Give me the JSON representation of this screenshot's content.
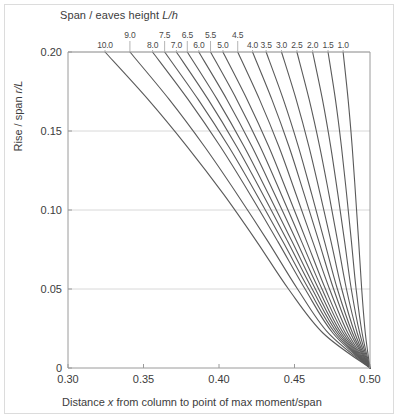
{
  "figure": {
    "background": "#ffffff",
    "frame_color": "#dcdcdc",
    "curve_color": "#5a5a5a",
    "grid_color": "#d8d8d8",
    "axis_color": "#9a9a9a",
    "text_color": "#3c3c3c"
  },
  "top_title": "Span / eaves height ",
  "top_title_italic": "L/h",
  "ylabel_text": "Rise / span ",
  "ylabel_italic": "r/L",
  "xlabel_pre": "Distance ",
  "xlabel_italic": "x",
  "xlabel_post": " from column to point of max moment/span",
  "chart_data": {
    "type": "line",
    "title": "Span / eaves height L/h",
    "xlabel": "Distance x from column to point of max moment/span",
    "ylabel": "Rise / span r/L",
    "xlim": [
      0.3,
      0.5
    ],
    "ylim": [
      0,
      0.2
    ],
    "xticks": [
      "0.30",
      "0.35",
      "0.40",
      "0.45",
      "0.50"
    ],
    "xtick_values": [
      0.3,
      0.35,
      0.4,
      0.45,
      0.5
    ],
    "yticks": [
      "0",
      "0.05",
      "0.10",
      "0.15",
      "0.20"
    ],
    "ytick_values": [
      0,
      0.05,
      0.1,
      0.15,
      0.2
    ],
    "grid": "horizontal",
    "legend": "none",
    "convergence_point": [
      0.5,
      0
    ],
    "series_label_name": "L/h",
    "series": [
      {
        "name": "10.0",
        "label": "10.0",
        "label_row": 1,
        "top_x": 0.3245,
        "values": [
          [
            0.3245,
            0.2
          ],
          [
            0.353,
            0.17
          ],
          [
            0.379,
            0.14
          ],
          [
            0.403,
            0.11
          ],
          [
            0.425,
            0.08
          ],
          [
            0.446,
            0.05
          ],
          [
            0.469,
            0.022
          ],
          [
            0.5,
            0.0
          ]
        ]
      },
      {
        "name": "9.0",
        "label": "9.0",
        "label_row": 0,
        "top_x": 0.341,
        "values": [
          [
            0.341,
            0.2
          ],
          [
            0.367,
            0.17
          ],
          [
            0.3905,
            0.14
          ],
          [
            0.412,
            0.11
          ],
          [
            0.4325,
            0.08
          ],
          [
            0.452,
            0.05
          ],
          [
            0.4725,
            0.022
          ],
          [
            0.5,
            0.0
          ]
        ]
      },
      {
        "name": "8.0",
        "label": "8.0",
        "label_row": 1,
        "top_x": 0.356,
        "values": [
          [
            0.356,
            0.2
          ],
          [
            0.3795,
            0.17
          ],
          [
            0.401,
            0.14
          ],
          [
            0.4205,
            0.11
          ],
          [
            0.439,
            0.08
          ],
          [
            0.457,
            0.05
          ],
          [
            0.4755,
            0.022
          ],
          [
            0.5,
            0.0
          ]
        ]
      },
      {
        "name": "7.5",
        "label": "7.5",
        "label_row": 0,
        "top_x": 0.364,
        "values": [
          [
            0.364,
            0.2
          ],
          [
            0.3862,
            0.17
          ],
          [
            0.4065,
            0.14
          ],
          [
            0.4248,
            0.11
          ],
          [
            0.4423,
            0.08
          ],
          [
            0.4594,
            0.05
          ],
          [
            0.477,
            0.022
          ],
          [
            0.5,
            0.0
          ]
        ]
      },
      {
        "name": "7.0",
        "label": "7.0",
        "label_row": 1,
        "top_x": 0.3718,
        "values": [
          [
            0.3718,
            0.2
          ],
          [
            0.3928,
            0.17
          ],
          [
            0.4118,
            0.14
          ],
          [
            0.429,
            0.11
          ],
          [
            0.4455,
            0.08
          ],
          [
            0.4617,
            0.05
          ],
          [
            0.4784,
            0.022
          ],
          [
            0.5,
            0.0
          ]
        ]
      },
      {
        "name": "6.5",
        "label": "6.5",
        "label_row": 0,
        "top_x": 0.379,
        "values": [
          [
            0.379,
            0.2
          ],
          [
            0.3988,
            0.17
          ],
          [
            0.4167,
            0.14
          ],
          [
            0.4328,
            0.11
          ],
          [
            0.4484,
            0.08
          ],
          [
            0.4638,
            0.05
          ],
          [
            0.4797,
            0.022
          ],
          [
            0.5,
            0.0
          ]
        ]
      },
      {
        "name": "6.0",
        "label": "6.0",
        "label_row": 1,
        "top_x": 0.3866,
        "values": [
          [
            0.3866,
            0.2
          ],
          [
            0.4052,
            0.17
          ],
          [
            0.4219,
            0.14
          ],
          [
            0.4369,
            0.11
          ],
          [
            0.4515,
            0.08
          ],
          [
            0.466,
            0.05
          ],
          [
            0.481,
            0.022
          ],
          [
            0.5,
            0.0
          ]
        ]
      },
      {
        "name": "5.5",
        "label": "5.5",
        "label_row": 0,
        "top_x": 0.3944,
        "values": [
          [
            0.3944,
            0.2
          ],
          [
            0.4117,
            0.17
          ],
          [
            0.4273,
            0.14
          ],
          [
            0.4412,
            0.11
          ],
          [
            0.4547,
            0.08
          ],
          [
            0.4682,
            0.05
          ],
          [
            0.4824,
            0.022
          ],
          [
            0.5,
            0.0
          ]
        ]
      },
      {
        "name": "5.0",
        "label": "5.0",
        "label_row": 1,
        "top_x": 0.4026,
        "values": [
          [
            0.4026,
            0.2
          ],
          [
            0.4186,
            0.17
          ],
          [
            0.433,
            0.14
          ],
          [
            0.4457,
            0.11
          ],
          [
            0.4581,
            0.08
          ],
          [
            0.4705,
            0.05
          ],
          [
            0.4838,
            0.022
          ],
          [
            0.5,
            0.0
          ]
        ]
      },
      {
        "name": "4.5",
        "label": "4.5",
        "label_row": 0,
        "top_x": 0.4124,
        "values": [
          [
            0.4124,
            0.2
          ],
          [
            0.4268,
            0.17
          ],
          [
            0.4397,
            0.14
          ],
          [
            0.451,
            0.11
          ],
          [
            0.4621,
            0.08
          ],
          [
            0.4732,
            0.05
          ],
          [
            0.4854,
            0.022
          ],
          [
            0.5,
            0.0
          ]
        ]
      },
      {
        "name": "4.0",
        "label": "4.0",
        "label_row": 1,
        "top_x": 0.4222,
        "values": [
          [
            0.4222,
            0.2
          ],
          [
            0.435,
            0.17
          ],
          [
            0.4464,
            0.14
          ],
          [
            0.4564,
            0.11
          ],
          [
            0.4662,
            0.08
          ],
          [
            0.4759,
            0.05
          ],
          [
            0.4871,
            0.022
          ],
          [
            0.5,
            0.0
          ]
        ]
      },
      {
        "name": "3.5",
        "label": "3.5",
        "label_row": 1,
        "top_x": 0.4312,
        "values": [
          [
            0.4312,
            0.2
          ],
          [
            0.4426,
            0.17
          ],
          [
            0.4526,
            0.14
          ],
          [
            0.4614,
            0.11
          ],
          [
            0.4699,
            0.08
          ],
          [
            0.4784,
            0.05
          ],
          [
            0.4885,
            0.022
          ],
          [
            0.5,
            0.0
          ]
        ]
      },
      {
        "name": "3.0",
        "label": "3.0",
        "label_row": 1,
        "top_x": 0.4414,
        "values": [
          [
            0.4414,
            0.2
          ],
          [
            0.4511,
            0.17
          ],
          [
            0.4596,
            0.14
          ],
          [
            0.467,
            0.11
          ],
          [
            0.4742,
            0.08
          ],
          [
            0.4813,
            0.05
          ],
          [
            0.49,
            0.022
          ],
          [
            0.5,
            0.0
          ]
        ]
      },
      {
        "name": "2.5",
        "label": "2.5",
        "label_row": 1,
        "top_x": 0.4516,
        "values": [
          [
            0.4516,
            0.2
          ],
          [
            0.4597,
            0.17
          ],
          [
            0.4667,
            0.14
          ],
          [
            0.4728,
            0.11
          ],
          [
            0.4786,
            0.08
          ],
          [
            0.4844,
            0.05
          ],
          [
            0.4916,
            0.022
          ],
          [
            0.5,
            0.0
          ]
        ]
      },
      {
        "name": "2.0",
        "label": "2.0",
        "label_row": 1,
        "top_x": 0.462,
        "values": [
          [
            0.462,
            0.2
          ],
          [
            0.4685,
            0.17
          ],
          [
            0.474,
            0.14
          ],
          [
            0.4787,
            0.11
          ],
          [
            0.4832,
            0.08
          ],
          [
            0.4876,
            0.05
          ],
          [
            0.4932,
            0.022
          ],
          [
            0.5,
            0.0
          ]
        ]
      },
      {
        "name": "1.5",
        "label": "1.5",
        "label_row": 1,
        "top_x": 0.4722,
        "values": [
          [
            0.4722,
            0.2
          ],
          [
            0.4771,
            0.17
          ],
          [
            0.4811,
            0.14
          ],
          [
            0.4845,
            0.11
          ],
          [
            0.4877,
            0.08
          ],
          [
            0.4908,
            0.05
          ],
          [
            0.4948,
            0.022
          ],
          [
            0.5,
            0.0
          ]
        ]
      },
      {
        "name": "1.0",
        "label": "1.0",
        "label_row": 1,
        "top_x": 0.4822,
        "values": [
          [
            0.4822,
            0.2
          ],
          [
            0.4855,
            0.17
          ],
          [
            0.4882,
            0.14
          ],
          [
            0.4904,
            0.11
          ],
          [
            0.4925,
            0.08
          ],
          [
            0.4945,
            0.05
          ],
          [
            0.4969,
            0.022
          ],
          [
            0.5,
            0.0
          ]
        ]
      }
    ]
  }
}
